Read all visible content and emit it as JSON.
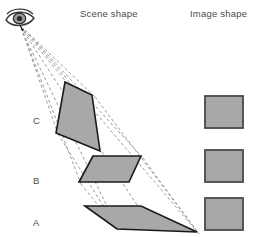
{
  "figure": {
    "title_left": "Scene shape",
    "title_right": "Image shape",
    "background_color": "#ffffff",
    "shape_fill": "#a8a8a8",
    "shape_stroke": "#1a1a1a",
    "ray_color": "#9a9a9a",
    "text_color": "#4a4a4a"
  },
  "headers": {
    "scene": "Scene shape",
    "image": "Image shape"
  },
  "rows": [
    {
      "id": "c",
      "label": "C"
    },
    {
      "id": "b",
      "label": "B"
    },
    {
      "id": "a",
      "label": "A"
    }
  ],
  "viewer": {
    "icon": "eye-icon",
    "x": 22,
    "y": 26
  },
  "scene_shapes": [
    {
      "row": "C",
      "points": "65,82 56,133 100,151 92,95",
      "description": "steeply slanted quadrilateral"
    },
    {
      "row": "B",
      "points": "93,156 79,182 129,182 141,156",
      "description": "parallelogram"
    },
    {
      "row": "A",
      "points": "85,206 117,229 197,232 141,206",
      "description": "flat elongated quadrilateral"
    }
  ],
  "image_shapes": [
    {
      "row": "C",
      "x": 205,
      "y": 96,
      "width": 38,
      "height": 32
    },
    {
      "row": "B",
      "x": 205,
      "y": 150,
      "width": 38,
      "height": 32
    },
    {
      "row": "A",
      "x": 205,
      "y": 198,
      "width": 38,
      "height": 32
    }
  ],
  "rays": [
    {
      "from": "22,29",
      "to": "65,82"
    },
    {
      "from": "22,29",
      "to": "92,95"
    },
    {
      "from": "22,29",
      "to": "56,133"
    },
    {
      "from": "22,29",
      "to": "100,151"
    },
    {
      "from": "22,29",
      "to": "197,232"
    },
    {
      "from": "22,29",
      "to": "141,156"
    },
    {
      "from": "22,29",
      "to": "129,182"
    }
  ]
}
